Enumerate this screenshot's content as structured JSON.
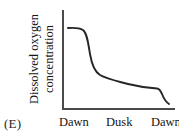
{
  "figure": {
    "option_letter": "(E)"
  },
  "chart_data": {
    "type": "line",
    "title": "",
    "subtitle": "",
    "xlabel": "",
    "ylabel": "Dissolved oxygen concentration",
    "ylabel_line1": "Dissolved oxygen",
    "ylabel_line2": "concentration",
    "xtick_labels": [
      "Dawn",
      "Dusk",
      "Dawn"
    ],
    "ytick_labels": [],
    "grid": false,
    "legend": null,
    "axis_color": "#4a4a4a",
    "line_color": "#262626",
    "xlim": [
      0,
      1
    ],
    "ylim": [
      0,
      1
    ],
    "series": [
      {
        "name": "Dissolved oxygen concentration",
        "x": [
          0.05,
          0.12,
          0.17,
          0.21,
          0.25,
          0.29,
          0.34,
          0.42,
          0.52,
          0.64,
          0.76,
          0.84,
          0.88,
          0.93,
          0.96
        ],
        "values": [
          0.82,
          0.82,
          0.8,
          0.72,
          0.55,
          0.42,
          0.34,
          0.29,
          0.26,
          0.23,
          0.21,
          0.19,
          0.18,
          0.1,
          0.05
        ]
      }
    ],
    "annotations": [
      "Curve is high and flat after Dawn, drops steeply in the early portion, plateaus at a low level through Dusk, then falls sharply again at the second Dawn."
    ],
    "path_d": "M 6 18 C 13 17.5, 17 17.5, 21 20 C 25 23, 26 32, 28 44 C 30 56, 33 62, 38 65 C 45 69, 55 71, 66 74 C 78 77, 88 78, 95 78.5 C 97 78.6, 98 79.5, 100 84 C 102 89, 104 92, 107 94"
  }
}
